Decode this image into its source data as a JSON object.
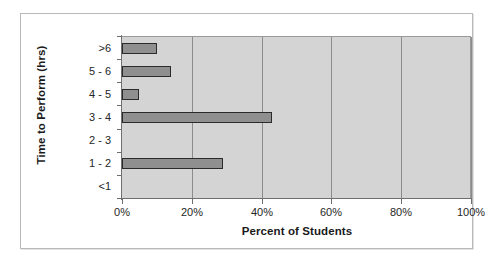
{
  "chart_data": {
    "type": "bar",
    "orientation": "horizontal",
    "title": "",
    "xlabel": "Percent of Students",
    "ylabel": "Time to Perform (hrs)",
    "categories": [
      ">6",
      "5 - 6",
      "4 - 5",
      "3 - 4",
      "2 - 3",
      "1 - 2",
      "<1"
    ],
    "values": [
      10,
      14,
      5,
      43,
      0,
      29,
      0
    ],
    "xlim": [
      0,
      100
    ],
    "xticks": [
      0,
      20,
      40,
      60,
      80,
      100
    ],
    "xtick_labels": [
      "0%",
      "20%",
      "40%",
      "60%",
      "80%",
      "100%"
    ],
    "grid": "vertical",
    "legend": "none",
    "colors": {
      "bar_fill": "#8f8f8f",
      "bar_border": "#2b2b2b",
      "plot_background": "#d4d4d4",
      "gridline": "#8c8c8c",
      "axis_line": "#6f6f6f",
      "frame_border": "#b9b9b9",
      "text": "#1a1a1a"
    }
  }
}
